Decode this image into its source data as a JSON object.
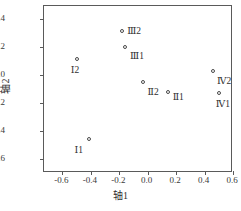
{
  "chart_data": {
    "type": "scatter",
    "title": "",
    "xlabel": "轴1",
    "ylabel": "轴2",
    "xlim": [
      -0.73,
      0.6
    ],
    "ylim": [
      -0.7,
      0.49
    ],
    "grid": false,
    "legend": "none",
    "marker": "open-circle",
    "xticks": [
      "-0.6",
      "-0.4",
      "-0.2",
      "0.0",
      "0.2",
      "0.4",
      "0.6"
    ],
    "xtick_values": [
      -0.6,
      -0.4,
      -0.2,
      0.0,
      0.2,
      0.4,
      0.6
    ],
    "yticks": [
      "0.4",
      "0.2",
      "0.0",
      "-0.2",
      "-0.4",
      "-0.6"
    ],
    "ytick_values": [
      0.4,
      0.2,
      0.0,
      -0.2,
      -0.4,
      -0.6
    ],
    "points": [
      {
        "label": "Ⅰ2",
        "x": -0.5,
        "y": 0.11,
        "label_dx": -6,
        "label_dy": 6
      },
      {
        "label": "Ⅰ1",
        "x": -0.41,
        "y": -0.46,
        "label_dx": -15,
        "label_dy": 6
      },
      {
        "label": "Ⅲ2",
        "x": -0.18,
        "y": 0.31,
        "label_dx": 5,
        "label_dy": -5
      },
      {
        "label": "Ⅲ1",
        "x": -0.16,
        "y": 0.2,
        "label_dx": 5,
        "label_dy": 4
      },
      {
        "label": "Ⅱ2",
        "x": -0.03,
        "y": -0.05,
        "label_dx": 4,
        "label_dy": 5
      },
      {
        "label": "Ⅱ1",
        "x": 0.14,
        "y": -0.12,
        "label_dx": 5,
        "label_dy": 0
      },
      {
        "label": "Ⅳ2",
        "x": 0.46,
        "y": 0.03,
        "label_dx": 4,
        "label_dy": 5
      },
      {
        "label": "Ⅳ1",
        "x": 0.5,
        "y": -0.13,
        "label_dx": -3,
        "label_dy": 6
      }
    ]
  },
  "axes": {
    "x_title": "轴1",
    "y_title": "轴2"
  }
}
